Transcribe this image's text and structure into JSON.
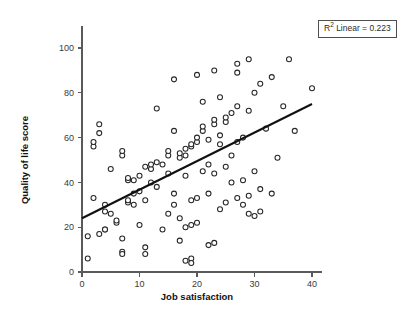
{
  "chart_data": {
    "type": "scatter",
    "title": "",
    "xlabel": "Job satisfaction",
    "ylabel": "Quality of life score",
    "xlim": [
      0,
      40
    ],
    "ylim": [
      0,
      100
    ],
    "xticks": [
      0,
      10,
      20,
      30,
      40
    ],
    "yticks": [
      0,
      20,
      40,
      60,
      80,
      100
    ],
    "xtick_labels": [
      "0",
      "10",
      "20",
      "30",
      "40"
    ],
    "ytick_labels": [
      "0",
      "20",
      "40",
      "60",
      "80",
      "100"
    ],
    "grid": false,
    "legend": false,
    "marker_style": "open-circle",
    "annotation": {
      "text_prefix": "R",
      "text_superscript": "2",
      "text_suffix": " Linear = 0.223",
      "r_squared": 0.223,
      "position": "top-right",
      "boxed": true
    },
    "fit_line": {
      "type": "linear",
      "x": [
        0,
        40
      ],
      "y": [
        24,
        75
      ],
      "intercept": 24,
      "slope": 1.275
    },
    "series": [
      {
        "name": "observations",
        "points": [
          [
            1,
            6
          ],
          [
            1,
            16
          ],
          [
            2,
            33
          ],
          [
            2,
            56
          ],
          [
            2,
            58
          ],
          [
            3,
            62
          ],
          [
            3,
            66
          ],
          [
            3,
            17
          ],
          [
            4,
            19
          ],
          [
            4,
            19
          ],
          [
            4,
            27
          ],
          [
            4,
            30
          ],
          [
            5,
            26
          ],
          [
            5,
            46
          ],
          [
            6,
            22
          ],
          [
            6,
            23
          ],
          [
            7,
            15
          ],
          [
            7,
            9
          ],
          [
            7,
            8
          ],
          [
            7,
            52
          ],
          [
            7,
            54
          ],
          [
            8,
            31
          ],
          [
            8,
            32
          ],
          [
            8,
            41
          ],
          [
            8,
            42
          ],
          [
            9,
            30
          ],
          [
            9,
            35
          ],
          [
            9,
            41
          ],
          [
            10,
            36
          ],
          [
            10,
            43
          ],
          [
            10,
            21
          ],
          [
            11,
            11
          ],
          [
            11,
            8
          ],
          [
            11,
            32
          ],
          [
            11,
            47
          ],
          [
            12,
            40
          ],
          [
            12,
            46
          ],
          [
            12,
            48
          ],
          [
            13,
            38
          ],
          [
            13,
            49
          ],
          [
            13,
            73
          ],
          [
            14,
            48
          ],
          [
            14,
            19
          ],
          [
            15,
            52
          ],
          [
            15,
            54
          ],
          [
            15,
            44
          ],
          [
            15,
            26
          ],
          [
            16,
            35
          ],
          [
            16,
            30
          ],
          [
            16,
            63
          ],
          [
            16,
            86
          ],
          [
            17,
            51
          ],
          [
            17,
            53
          ],
          [
            17,
            24
          ],
          [
            17,
            14
          ],
          [
            18,
            52
          ],
          [
            18,
            55
          ],
          [
            18,
            43
          ],
          [
            18,
            20
          ],
          [
            18,
            5
          ],
          [
            19,
            56
          ],
          [
            19,
            57
          ],
          [
            19,
            32
          ],
          [
            19,
            21
          ],
          [
            19,
            6
          ],
          [
            19,
            4
          ],
          [
            20,
            58
          ],
          [
            20,
            60
          ],
          [
            20,
            88
          ],
          [
            20,
            33
          ],
          [
            20,
            22
          ],
          [
            21,
            63
          ],
          [
            21,
            65
          ],
          [
            21,
            45
          ],
          [
            21,
            76
          ],
          [
            22,
            59
          ],
          [
            22,
            48
          ],
          [
            22,
            35
          ],
          [
            22,
            12
          ],
          [
            23,
            66
          ],
          [
            23,
            68
          ],
          [
            23,
            90
          ],
          [
            23,
            44
          ],
          [
            23,
            13
          ],
          [
            24,
            57
          ],
          [
            24,
            61
          ],
          [
            24,
            78
          ],
          [
            24,
            28
          ],
          [
            25,
            67
          ],
          [
            25,
            69
          ],
          [
            25,
            47
          ],
          [
            25,
            31
          ],
          [
            26,
            71
          ],
          [
            26,
            52
          ],
          [
            26,
            40
          ],
          [
            27,
            74
          ],
          [
            27,
            93
          ],
          [
            27,
            89
          ],
          [
            27,
            58
          ],
          [
            27,
            33
          ],
          [
            28,
            60
          ],
          [
            28,
            41
          ],
          [
            28,
            30
          ],
          [
            29,
            95
          ],
          [
            29,
            72
          ],
          [
            29,
            34
          ],
          [
            29,
            26
          ],
          [
            30,
            80
          ],
          [
            30,
            45
          ],
          [
            30,
            25
          ],
          [
            31,
            84
          ],
          [
            31,
            37
          ],
          [
            31,
            27
          ],
          [
            32,
            64
          ],
          [
            33,
            87
          ],
          [
            33,
            35
          ],
          [
            34,
            51
          ],
          [
            35,
            74
          ],
          [
            36,
            95
          ],
          [
            37,
            63
          ],
          [
            40,
            82
          ]
        ]
      }
    ]
  },
  "annotation_text": "R2 Linear = 0.223"
}
